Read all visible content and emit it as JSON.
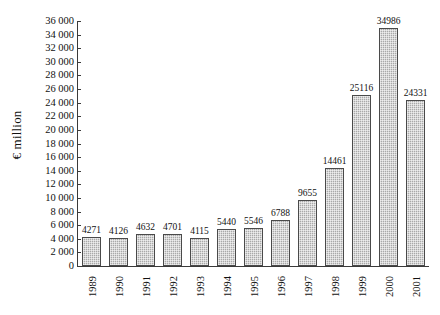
{
  "chart_data": {
    "type": "bar",
    "title": "",
    "subtitle": "",
    "xlabel": "",
    "ylabel": "€ million",
    "categories": [
      "1989",
      "1990",
      "1991",
      "1992",
      "1993",
      "1994",
      "1995",
      "1996",
      "1997",
      "1998",
      "1999",
      "2000",
      "2001"
    ],
    "values": [
      4271,
      4126,
      4632,
      4701,
      4115,
      5440,
      5546,
      6788,
      9655,
      14461,
      25116,
      34986,
      24331
    ],
    "data_labels": [
      "4271",
      "4126",
      "4632",
      "4701",
      "4115",
      "5440",
      "5546",
      "6788",
      "9655",
      "14461",
      "25116",
      "34986",
      "24331"
    ],
    "ylim": [
      0,
      36000
    ],
    "ytick_step": 2000,
    "ytick_values": [
      0,
      2000,
      4000,
      6000,
      8000,
      10000,
      12000,
      14000,
      16000,
      18000,
      20000,
      22000,
      24000,
      26000,
      28000,
      30000,
      32000,
      34000,
      36000
    ],
    "ytick_labels": [
      "0",
      "2 000",
      "4 000",
      "6 000",
      "8 000",
      "10 000",
      "12 000",
      "14 000",
      "16 000",
      "18 000",
      "20 000",
      "22 000",
      "24 000",
      "26 000",
      "28 000",
      "30 000",
      "32 000",
      "34 000",
      "36 000"
    ],
    "grid": false,
    "legend": false,
    "legend_position": "none",
    "series": [
      {
        "name": "€ million",
        "values": [
          4271,
          4126,
          4632,
          4701,
          4115,
          5440,
          5546,
          6788,
          9655,
          14461,
          25116,
          34986,
          24331
        ]
      }
    ],
    "colors": {
      "bar_fill": "#a9a9a9",
      "bar_border": "#4a4a4a",
      "axis": "#3a3a3a",
      "text": "#111111",
      "background": "#ffffff"
    }
  }
}
